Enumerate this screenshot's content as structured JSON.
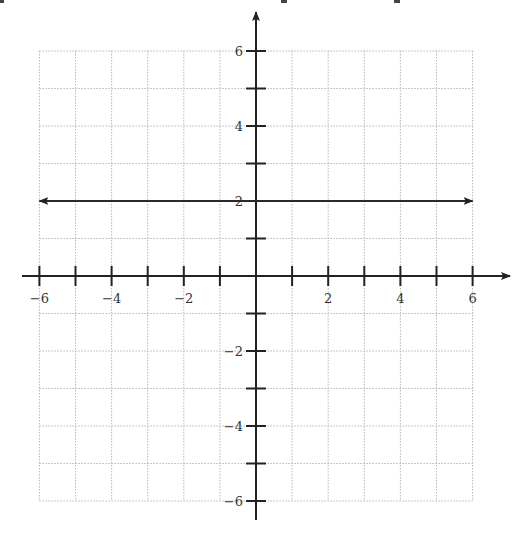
{
  "chart_data": {
    "type": "line",
    "title": "",
    "xlabel": "",
    "ylabel": "",
    "xlim": [
      -6,
      6
    ],
    "ylim": [
      -6,
      6
    ],
    "grid": true,
    "x_ticks": [
      -6,
      -5,
      -4,
      -3,
      -2,
      -1,
      1,
      2,
      3,
      4,
      5,
      6
    ],
    "y_ticks": [
      -6,
      -5,
      -4,
      -3,
      -2,
      -1,
      1,
      2,
      3,
      4,
      5,
      6
    ],
    "x_tick_labels": [
      "-6",
      "-4",
      "-2",
      "2",
      "4",
      "6"
    ],
    "y_tick_labels": [
      "6",
      "4",
      "2",
      "-2",
      "-4",
      "-6"
    ],
    "series": [
      {
        "name": "y = 2",
        "equation": "y = 2",
        "x": [
          -6,
          6
        ],
        "y": [
          2,
          2
        ],
        "arrows": "both"
      }
    ],
    "legend": null
  },
  "colors": {
    "axis": "#222222",
    "line": "#2a2a2a",
    "grid": "#b8b8b8",
    "label": "#333333"
  }
}
